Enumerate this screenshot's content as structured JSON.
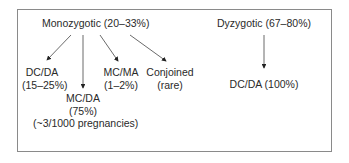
{
  "diagram": {
    "monozygotic": {
      "title": "Monozygotic (20–33%)",
      "children": [
        {
          "line1": "DC/DA",
          "line2": "(15–25%)"
        },
        {
          "line1": "MC/DA",
          "line2": "(75%)",
          "line3": "(~3/1000 pregnancies)"
        },
        {
          "line1": "MC/MA",
          "line2": "(1–2%)"
        },
        {
          "line1": "Conjoined",
          "line2": "(rare)"
        }
      ]
    },
    "dizygotic": {
      "title": "Dyzygotic (67–80%)",
      "child": "DC/DA (100%)"
    }
  }
}
